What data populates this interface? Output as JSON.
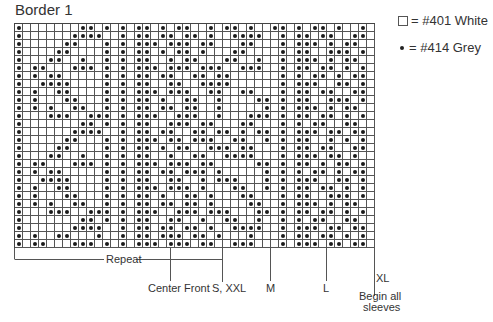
{
  "title": "Border 1",
  "legend": {
    "white": {
      "symbol": "□",
      "label": "= #401 White"
    },
    "grey": {
      "symbol": "•",
      "label": "= #414 Grey"
    }
  },
  "grid": {
    "cols": 45,
    "rows": [
      "X.......XX.X.X.XX.X.XX..X.XX.X..XX.X.XX.X..X.",
      "X......XXXX..X.XX.XX.XX.X..XXXX..X.XX.XX..XX.",
      "X.....XX...X.X.XXX.XXX.XX...XX...X.XXX.X.XX..",
      "X....XX....X.X.XX.X.XX.X...XX....X.XX..XXX.X.",
      "X...XX..X..X.X.XX..X.XX...XX..X..X.XXX.X.XX..",
      "X.XX...XXX.X.X.XXX.XXX.XXX..XXX..X.XX.XX.X.X.",
      "X.X.XX.....X.X.XX.XX..XX.XX......X.X.XX.X.XX.",
      "X..XXXX....X.X.XX..XX..XXXX......X.XXX..XX.X.",
      "X.X..XX....X.X.XXX.XXX..XX..XX...X.XX.XX..XX.",
      "X.X...XX...X.X.XX.X..XX..X....XX.X.XX..XXX.X.",
      "X.X.X..XX..X.X.XX.XX.XX..X.....X.X.XXX.X.XX..",
      "X...XXX..XXX.X.XXX..XXX..X...XXX.X.XX.XX.X.X.",
      "X.......XX.X.X.XX..XXX.XX...XX...X.X.XX..XX..",
      "X......XXXX..X.XX.XX..XX.XX.X.XX.X.XXX.XX.XX.",
      "X.....XX...X.X.XXX.XX.XXX..XX..X.X.XX..X.X.X.",
      "X....XX....X.X.XX.X.XX..XXX.XX...X.XX.XX..XX.",
      "X...XX..X..X.X.XX..X..XX..XXXX...X.XXX.XX.X..",
      "X.XX...XXX.X.X.XXX.XXX.XX.....XX.X.XX.X.XX.X.",
      "X.X.XX.....X.X.XX.XX.XXX.X.....X.X.X.XX.X.XX.",
      "X..XXXX....X.X.XX..XX..X.XXX...X.X.XXX..XX.X.",
      "X.X..XX....X.X.XXX.XXX.X...XX..X.X.XX.XX.X.X.",
      "X.X...XX...X.X.XX.X..XX.X...XX...X.XX..XXX.X.",
      "X.X.X..XX..X.X.XX.XX.XX.X....XX..X.XXX.X.XX..",
      "X...XXX..XXX.X.XXX..XXX.XXX...XX.X.XX.XX.X.X.",
      "X.......XX.X.X.XX..XX..X..XX..X..X.X.XX..XX..",
      "X......XXXX..X.XX.XX.XX.X..XXXX..X.XXX.XX.XX.",
      "X.X..XX...X..X.XX.XXX.XX.X...X...X.XX.XX.X.X.",
      "X.XX...XXX.X.X.XXX.XXX.XX..XXX...X.XXX.XX.XX."
    ]
  },
  "markers": {
    "repeat": "Repeat",
    "center_front": "Center Front",
    "s_xxl": "S, XXL",
    "m": "M",
    "l": "L",
    "xl": "XL",
    "begin_line1": "Begin all",
    "begin_line2": "sleeves"
  }
}
